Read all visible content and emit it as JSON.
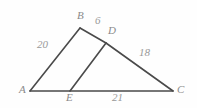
{
  "figure": {
    "background_color": "#fefefe",
    "stroke_color": "#4a4a4a",
    "label_color": "#8c8c8c",
    "vertices": [
      {
        "name": "A",
        "label": "A",
        "x": 30,
        "y": 91,
        "label_x": 19,
        "label_y": 84
      },
      {
        "name": "B",
        "label": "B",
        "x": 80,
        "y": 28,
        "label_x": 77,
        "label_y": 10
      },
      {
        "name": "C",
        "label": "C",
        "x": 173,
        "y": 91,
        "label_x": 177,
        "label_y": 84
      },
      {
        "name": "D",
        "label": "D",
        "x": 106,
        "y": 43,
        "label_x": 108,
        "label_y": 25
      },
      {
        "name": "E",
        "label": "E",
        "x": 70,
        "y": 91,
        "label_x": 66,
        "label_y": 92
      }
    ],
    "segments": [
      {
        "name": "segment-AB",
        "from": "A",
        "to": "B"
      },
      {
        "name": "segment-BD",
        "from": "B",
        "to": "D"
      },
      {
        "name": "segment-DC",
        "from": "D",
        "to": "C"
      },
      {
        "name": "segment-AC",
        "from": "A",
        "to": "C"
      },
      {
        "name": "segment-ED",
        "from": "E",
        "to": "D"
      }
    ],
    "measures": [
      {
        "name": "measure-AB",
        "segment": "AB",
        "value": "20",
        "x": 37,
        "y": 39
      },
      {
        "name": "measure-BD",
        "segment": "BD",
        "value": "6",
        "x": 95,
        "y": 15
      },
      {
        "name": "measure-DC",
        "segment": "DC",
        "value": "18",
        "x": 139,
        "y": 47
      },
      {
        "name": "measure-EC",
        "segment": "EC",
        "value": "21",
        "x": 112,
        "y": 92
      }
    ]
  }
}
